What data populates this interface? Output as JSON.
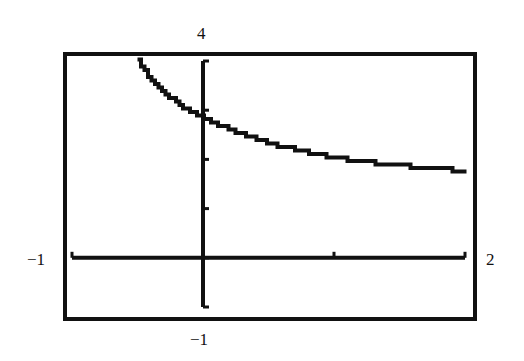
{
  "chart_data": {
    "type": "line",
    "title": "",
    "xlabel": "",
    "ylabel": "",
    "xlim": [
      -1,
      2
    ],
    "ylim": [
      -1,
      4
    ],
    "xticks": [
      -1,
      0,
      1,
      2
    ],
    "yticks": [
      -1,
      0,
      1,
      2,
      3,
      4
    ],
    "grid": false,
    "legend": null,
    "window_labels": {
      "xmin": "−1",
      "xmax": "2",
      "ymin": "−1",
      "ymax": "4"
    },
    "series": [
      {
        "name": "curve",
        "x": [
          -0.5,
          -0.4,
          -0.3,
          -0.2,
          -0.1,
          0.0,
          0.25,
          0.5,
          0.75,
          1.0,
          1.25,
          1.5,
          1.75,
          2.0
        ],
        "y": [
          4.0,
          3.6,
          3.35,
          3.15,
          2.98,
          2.85,
          2.55,
          2.33,
          2.17,
          2.04,
          1.95,
          1.88,
          1.82,
          1.77
        ]
      }
    ],
    "colors": {
      "ink": "#111111",
      "background": "#ffffff"
    }
  }
}
